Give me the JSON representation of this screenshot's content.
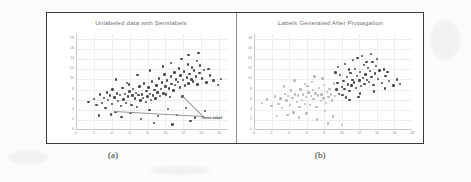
{
  "figure": {
    "captions": {
      "left": "(a)",
      "right": "(b)"
    }
  },
  "chart_data": [
    {
      "type": "scatter",
      "panel": "a",
      "title": "Unlabeled data with Semilabels",
      "xlabel": "",
      "ylabel": "",
      "xlim": [
        0,
        17
      ],
      "ylim": [
        0,
        19
      ],
      "xticks": [
        0,
        2,
        4,
        6,
        8,
        10,
        12,
        14,
        16
      ],
      "yticks": [
        0,
        2,
        4,
        6,
        8,
        10,
        12,
        14,
        16,
        18
      ],
      "grid": true,
      "legend": "none",
      "annotations": [
        {
          "text": "Semi-label",
          "x": 14.2,
          "y": 2.6,
          "bold": true,
          "points_to": [
            [
              11.9,
              6.6
            ],
            [
              4.4,
              3.6
            ]
          ]
        }
      ],
      "series": [
        {
          "name": "unlabeled",
          "color": "#4a4a4a",
          "points": [
            [
              1.4,
              5.6
            ],
            [
              2.0,
              6.1
            ],
            [
              2.3,
              4.9
            ],
            [
              2.7,
              7.0
            ],
            [
              2.9,
              5.4
            ],
            [
              3.1,
              6.3
            ],
            [
              3.3,
              4.4
            ],
            [
              3.5,
              7.4
            ],
            [
              3.6,
              5.9
            ],
            [
              3.8,
              6.8
            ],
            [
              4.0,
              5.1
            ],
            [
              4.1,
              8.0
            ],
            [
              4.3,
              6.4
            ],
            [
              4.4,
              3.6
            ],
            [
              4.6,
              7.2
            ],
            [
              4.7,
              5.7
            ],
            [
              4.9,
              6.9
            ],
            [
              5.0,
              4.7
            ],
            [
              5.2,
              8.3
            ],
            [
              5.3,
              6.0
            ],
            [
              5.5,
              7.1
            ],
            [
              5.6,
              5.3
            ],
            [
              5.8,
              6.6
            ],
            [
              5.9,
              9.0
            ],
            [
              6.0,
              7.6
            ],
            [
              6.2,
              5.0
            ],
            [
              6.3,
              6.8
            ],
            [
              6.4,
              8.1
            ],
            [
              6.6,
              6.2
            ],
            [
              6.7,
              7.3
            ],
            [
              6.8,
              4.6
            ],
            [
              7.0,
              6.9
            ],
            [
              7.1,
              8.6
            ],
            [
              7.2,
              5.8
            ],
            [
              7.4,
              7.0
            ],
            [
              7.5,
              6.3
            ],
            [
              7.6,
              9.2
            ],
            [
              7.8,
              5.5
            ],
            [
              7.9,
              7.7
            ],
            [
              8.0,
              6.6
            ],
            [
              8.1,
              8.4
            ],
            [
              8.3,
              7.1
            ],
            [
              8.4,
              5.9
            ],
            [
              8.5,
              9.6
            ],
            [
              8.6,
              6.8
            ],
            [
              8.8,
              7.9
            ],
            [
              8.9,
              6.2
            ],
            [
              9.0,
              8.8
            ],
            [
              9.1,
              7.4
            ],
            [
              9.3,
              10.2
            ],
            [
              9.4,
              6.7
            ],
            [
              9.5,
              8.1
            ],
            [
              9.6,
              9.4
            ],
            [
              9.8,
              7.2
            ],
            [
              9.9,
              11.0
            ],
            [
              10.0,
              8.6
            ],
            [
              10.1,
              7.0
            ],
            [
              10.2,
              9.8
            ],
            [
              10.4,
              8.2
            ],
            [
              10.5,
              6.5
            ],
            [
              10.6,
              10.6
            ],
            [
              10.7,
              9.1
            ],
            [
              10.9,
              7.8
            ],
            [
              11.0,
              11.4
            ],
            [
              11.1,
              8.9
            ],
            [
              11.2,
              10.0
            ],
            [
              11.4,
              9.5
            ],
            [
              11.5,
              12.2
            ],
            [
              11.6,
              8.4
            ],
            [
              11.7,
              10.8
            ],
            [
              11.9,
              6.6
            ],
            [
              12.0,
              9.9
            ],
            [
              12.1,
              11.6
            ],
            [
              12.2,
              8.8
            ],
            [
              12.4,
              10.4
            ],
            [
              12.5,
              13.0
            ],
            [
              12.6,
              9.2
            ],
            [
              12.7,
              11.1
            ],
            [
              12.9,
              10.0
            ],
            [
              13.0,
              12.4
            ],
            [
              13.1,
              9.6
            ],
            [
              13.2,
              11.8
            ],
            [
              13.4,
              10.6
            ],
            [
              13.5,
              13.6
            ],
            [
              13.6,
              9.0
            ],
            [
              13.8,
              11.3
            ],
            [
              13.9,
              12.8
            ],
            [
              14.1,
              10.2
            ],
            [
              14.3,
              11.9
            ],
            [
              14.6,
              9.4
            ],
            [
              15.0,
              10.8
            ],
            [
              15.4,
              9.8
            ],
            [
              15.9,
              8.9
            ],
            [
              16.2,
              10.1
            ],
            [
              2.6,
              2.9
            ],
            [
              3.9,
              3.1
            ],
            [
              5.1,
              2.6
            ],
            [
              6.1,
              3.4
            ],
            [
              7.3,
              2.2
            ],
            [
              8.2,
              3.9
            ],
            [
              9.2,
              2.8
            ],
            [
              10.3,
              4.1
            ],
            [
              11.3,
              3.0
            ],
            [
              12.3,
              4.4
            ],
            [
              13.3,
              2.5
            ],
            [
              14.4,
              3.7
            ],
            [
              8.7,
              1.4
            ],
            [
              10.8,
              1.1
            ],
            [
              12.8,
              1.8
            ],
            [
              4.5,
              10.0
            ],
            [
              5.7,
              9.3
            ],
            [
              6.9,
              10.9
            ],
            [
              8.3,
              11.8
            ],
            [
              9.7,
              12.6
            ],
            [
              11.8,
              14.0
            ],
            [
              12.6,
              14.8
            ],
            [
              13.7,
              15.2
            ],
            [
              10.6,
              13.2
            ],
            [
              14.8,
              12.1
            ]
          ]
        }
      ]
    },
    {
      "type": "scatter",
      "panel": "b",
      "title": "Labels Generated After Propagation",
      "xlabel": "",
      "ylabel": "",
      "xlim": [
        0,
        18
      ],
      "ylim": [
        0,
        19
      ],
      "xticks": [
        0,
        2,
        4,
        6,
        8,
        10,
        12,
        14,
        16,
        18
      ],
      "yticks": [
        0,
        2,
        4,
        6,
        8,
        10,
        12,
        14,
        16,
        18
      ],
      "grid": true,
      "legend": "none",
      "annotations": [],
      "series": [
        {
          "name": "class-light",
          "color": "#b9b9b9",
          "points": [
            [
              0.9,
              5.4
            ],
            [
              1.5,
              6.0
            ],
            [
              2.0,
              4.8
            ],
            [
              2.4,
              6.6
            ],
            [
              2.8,
              5.2
            ],
            [
              3.0,
              6.2
            ],
            [
              3.2,
              4.3
            ],
            [
              3.5,
              7.1
            ],
            [
              3.7,
              5.8
            ],
            [
              3.9,
              6.7
            ],
            [
              4.1,
              5.0
            ],
            [
              4.2,
              7.8
            ],
            [
              4.4,
              6.3
            ],
            [
              4.5,
              3.5
            ],
            [
              4.7,
              7.0
            ],
            [
              4.9,
              5.6
            ],
            [
              5.0,
              6.8
            ],
            [
              5.2,
              4.6
            ],
            [
              5.3,
              8.0
            ],
            [
              5.5,
              5.9
            ],
            [
              5.6,
              7.0
            ],
            [
              5.8,
              5.2
            ],
            [
              5.9,
              6.5
            ],
            [
              6.1,
              8.7
            ],
            [
              6.2,
              7.4
            ],
            [
              6.4,
              4.9
            ],
            [
              6.5,
              6.7
            ],
            [
              6.7,
              7.9
            ],
            [
              6.8,
              6.1
            ],
            [
              7.0,
              7.2
            ],
            [
              7.1,
              4.5
            ],
            [
              7.3,
              6.8
            ],
            [
              7.4,
              8.3
            ],
            [
              7.6,
              5.7
            ],
            [
              7.7,
              7.0
            ],
            [
              7.9,
              6.2
            ],
            [
              8.0,
              8.9
            ],
            [
              8.2,
              5.4
            ],
            [
              8.3,
              7.5
            ],
            [
              8.5,
              6.5
            ],
            [
              8.6,
              8.1
            ],
            [
              8.8,
              7.0
            ],
            [
              8.9,
              5.8
            ],
            [
              9.1,
              9.2
            ],
            [
              9.2,
              6.7
            ],
            [
              2.6,
              2.8
            ],
            [
              3.8,
              3.0
            ],
            [
              5.1,
              2.5
            ],
            [
              6.0,
              3.3
            ],
            [
              7.2,
              2.1
            ],
            [
              8.1,
              3.8
            ],
            [
              9.0,
              2.7
            ],
            [
              4.6,
              9.8
            ],
            [
              5.8,
              9.1
            ],
            [
              6.9,
              10.6
            ],
            [
              8.4,
              1.3
            ],
            [
              10.0,
              1.0
            ],
            [
              6.6,
              9.5
            ],
            [
              3.4,
              8.6
            ],
            [
              7.8,
              10.2
            ]
          ]
        },
        {
          "name": "class-dark",
          "color": "#4a4a4a",
          "points": [
            [
              9.4,
              8.0
            ],
            [
              9.5,
              9.3
            ],
            [
              9.7,
              7.1
            ],
            [
              9.8,
              10.9
            ],
            [
              10.0,
              8.5
            ],
            [
              10.1,
              6.9
            ],
            [
              10.2,
              9.7
            ],
            [
              10.3,
              8.1
            ],
            [
              10.5,
              6.4
            ],
            [
              10.6,
              10.5
            ],
            [
              10.7,
              9.0
            ],
            [
              10.9,
              7.7
            ],
            [
              11.0,
              11.3
            ],
            [
              11.1,
              8.8
            ],
            [
              11.2,
              9.9
            ],
            [
              11.4,
              9.4
            ],
            [
              11.5,
              12.1
            ],
            [
              11.6,
              8.3
            ],
            [
              11.7,
              10.7
            ],
            [
              11.9,
              6.5
            ],
            [
              12.0,
              9.8
            ],
            [
              12.1,
              11.5
            ],
            [
              12.2,
              8.7
            ],
            [
              12.4,
              10.3
            ],
            [
              12.5,
              12.9
            ],
            [
              12.6,
              9.1
            ],
            [
              12.7,
              11.0
            ],
            [
              12.9,
              9.9
            ],
            [
              13.0,
              12.3
            ],
            [
              13.1,
              9.5
            ],
            [
              13.2,
              11.7
            ],
            [
              13.4,
              10.5
            ],
            [
              13.5,
              13.5
            ],
            [
              13.6,
              8.9
            ],
            [
              13.8,
              11.2
            ],
            [
              13.9,
              12.7
            ],
            [
              14.1,
              10.1
            ],
            [
              14.3,
              11.8
            ],
            [
              14.6,
              9.3
            ],
            [
              15.0,
              10.7
            ],
            [
              15.4,
              9.7
            ],
            [
              15.9,
              8.8
            ],
            [
              16.3,
              10.0
            ],
            [
              9.6,
              12.5
            ],
            [
              10.4,
              13.1
            ],
            [
              11.3,
              13.9
            ],
            [
              12.3,
              14.7
            ],
            [
              13.3,
              15.1
            ],
            [
              14.8,
              12.0
            ],
            [
              11.8,
              14.3
            ],
            [
              10.8,
              12.0
            ],
            [
              12.8,
              13.4
            ],
            [
              9.3,
              11.4
            ],
            [
              14.0,
              14.0
            ],
            [
              15.2,
              11.5
            ],
            [
              13.7,
              7.6
            ],
            [
              14.9,
              8.2
            ],
            [
              12.1,
              7.2
            ],
            [
              10.9,
              5.9
            ],
            [
              16.6,
              9.1
            ]
          ]
        }
      ]
    }
  ]
}
